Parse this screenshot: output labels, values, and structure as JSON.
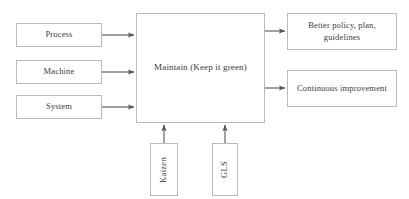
{
  "diagram": {
    "background_color": "#ffffff",
    "border_color": "#b9b9b9",
    "text_color": "#3b3b3b",
    "arrow_color": "#555555",
    "inputs": [
      {
        "label": "Process"
      },
      {
        "label": "Machine"
      },
      {
        "label": "System"
      }
    ],
    "center": {
      "label": "Maintain (Keep it green)"
    },
    "outputs": [
      {
        "label": "Better policy, plan, guidelines"
      },
      {
        "label": "Continuous improvement"
      }
    ],
    "enablers": [
      {
        "label": "Kaizen"
      },
      {
        "label": "GLS"
      }
    ]
  }
}
